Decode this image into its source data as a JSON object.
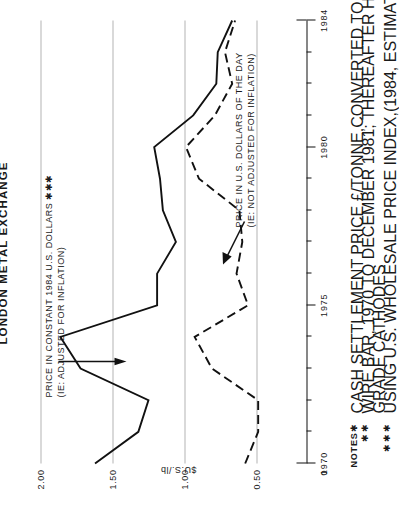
{
  "figure": {
    "title": "LONDON METAL EXCHANGE",
    "y_axis_caption": "$U.S./lb",
    "zero_label": "0"
  },
  "annotations": [
    {
      "id": "constant-dollars",
      "line1": "PRICE IN CONSTANT 1984 U.S. DOLLARS ✱✱✱",
      "line2": "(IE: ADJUSTED FOR INFLATION)"
    },
    {
      "id": "current-dollars",
      "line1": "PRICE IN U.S. DOLLARS OF THE DAY",
      "line2": "(IE: NOT ADJUSTED FOR INFLATION)"
    }
  ],
  "notes": {
    "heading": "NOTES :",
    "items": [
      {
        "mark": "✱",
        "text": "CASH SETTLEMENT PRICE £/TONNE,CONVERTED TO $U.S./lb"
      },
      {
        "mark": "✱✱",
        "text": "WIRE BAR, 1970 TO DECEMBER 1981; THEREAFTER HIGHER"
      },
      {
        "mark": "",
        "text": "GRADE CATHODES"
      },
      {
        "mark": "✱✱✱",
        "text": "USING U.S. WHOLESALE PRICE INDEX,(1984, ESTIMATED)"
      }
    ]
  },
  "chart_data": {
    "type": "line",
    "title": "LONDON METAL EXCHANGE",
    "xlabel": "",
    "ylabel": "$U.S./lb",
    "xlim": [
      1970,
      1984
    ],
    "ylim": [
      0.28,
      2.15
    ],
    "grid": true,
    "y_ticks": [
      2.0,
      1.5,
      1.0,
      0.5
    ],
    "y_tick_labels": [
      "2.00",
      "1.50",
      "1.00",
      "0.50"
    ],
    "x_ticks": [
      1970,
      1971,
      1972,
      1973,
      1974,
      1975,
      1976,
      1977,
      1978,
      1979,
      1980,
      1981,
      1982,
      1983,
      1984
    ],
    "x_tick_labels_shown": [
      "1970",
      "1975",
      "1980",
      "1984"
    ],
    "x_major_ticks": [
      1970,
      1975,
      1980,
      1984
    ],
    "legend_position": "inline-annotation",
    "series": [
      {
        "name": "PRICE IN CONSTANT 1984 U.S. DOLLARS",
        "style": "solid",
        "color": "#111111",
        "x": [
          1970,
          1971,
          1972,
          1973,
          1974,
          1975,
          1976,
          1977,
          1978,
          1979,
          1980,
          1981,
          1982,
          1983,
          1984
        ],
        "values": [
          1.62,
          1.32,
          1.25,
          1.72,
          1.86,
          1.19,
          1.19,
          1.06,
          1.15,
          1.17,
          1.21,
          0.94,
          0.78,
          0.77,
          0.67
        ]
      },
      {
        "name": "PRICE IN U.S. DOLLARS OF THE DAY",
        "style": "dashed",
        "color": "#111111",
        "x": [
          1970,
          1971,
          1972,
          1973,
          1974,
          1975,
          1976,
          1977,
          1978,
          1979,
          1980,
          1981,
          1982,
          1983,
          1984
        ],
        "values": [
          0.58,
          0.49,
          0.49,
          0.81,
          0.93,
          0.56,
          0.64,
          0.6,
          0.62,
          0.9,
          0.99,
          0.79,
          0.67,
          0.72,
          0.65
        ]
      }
    ]
  }
}
